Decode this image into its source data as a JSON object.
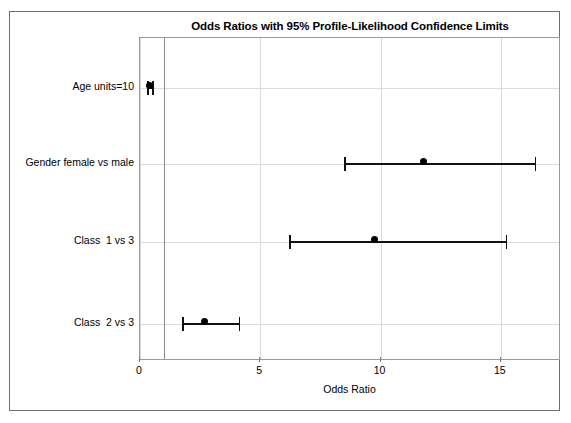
{
  "figure": {
    "background_color": "#ffffff",
    "frame_color": "#6e6e6e",
    "plot_border_color": "#9a9a9a",
    "grid_color": "#d9d9d9",
    "marker_color": "#000000",
    "reference_line_color": "#8a8a8a"
  },
  "chart_data": {
    "type": "scatter",
    "subtype": "forest-plot",
    "title": "Odds Ratios with 95% Profile-Likelihood Confidence Limits",
    "xlabel": "Odds Ratio",
    "ylabel": "",
    "xlim": [
      0,
      17.5
    ],
    "xticks": [
      0,
      5,
      10,
      15
    ],
    "xtick_labels": [
      "0",
      "5",
      "10",
      "15"
    ],
    "grid": true,
    "legend": "none",
    "reference_line": 1,
    "categories": [
      "Age units=10",
      "Gender female vs male",
      "Class  1 vs 3",
      "Class  2 vs 3"
    ],
    "values": [
      0.39,
      11.8,
      9.75,
      2.7
    ],
    "ci_lower": [
      0.3,
      8.5,
      6.2,
      1.75
    ],
    "ci_upper": [
      0.5,
      16.4,
      15.2,
      4.1
    ],
    "points": [
      {
        "label": "Age units=10",
        "estimate": 0.39,
        "lower": 0.3,
        "upper": 0.5
      },
      {
        "label": "Gender female vs male",
        "estimate": 11.8,
        "lower": 8.5,
        "upper": 16.4
      },
      {
        "label": "Class  1 vs 3",
        "estimate": 9.75,
        "lower": 6.2,
        "upper": 15.2
      },
      {
        "label": "Class  2 vs 3",
        "estimate": 2.7,
        "lower": 1.75,
        "upper": 4.1
      }
    ]
  }
}
